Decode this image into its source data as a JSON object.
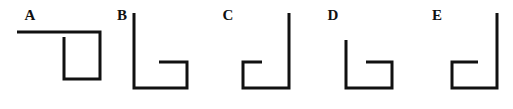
{
  "panel": {
    "name": "bracket-shape-comparison-figure",
    "background_color": "#ffffff",
    "stroke_color": "#111111",
    "stroke_width": 3,
    "width": 513,
    "height": 109
  },
  "figures": [
    {
      "id": "A",
      "label": "A",
      "label_x": 30,
      "label_y": 20,
      "description": "U-bracket with long horizontal arm extending far to the left from the top-right corner",
      "polyline": "17,32 100,32 100,79 64,79 64,37",
      "shape_kind": "extended-top-arm-bracket"
    },
    {
      "id": "B",
      "label": "B",
      "label_x": 122,
      "label_y": 20,
      "description": "Tall left stem, bottom bar, right stem rising to mid height with a short inward arm pointing left",
      "polyline": "134,13 134,88 187,88 187,62 159,62",
      "shape_kind": "tall-left-stem-bracket"
    },
    {
      "id": "C",
      "label": "C",
      "label_x": 228,
      "label_y": 20,
      "description": "Tall right stem, bottom bar, left stem rising to mid height with a short inward arm pointing right",
      "polyline": "289,13 289,88 243,88 243,62 262,62",
      "shape_kind": "tall-right-stem-bracket"
    },
    {
      "id": "D",
      "label": "D",
      "label_x": 333,
      "label_y": 20,
      "description": "Medium left stem, bottom bar, right stem rising to mid height with a short inward arm pointing left",
      "polyline": "346,40 346,88 392,88 392,62 366,62",
      "shape_kind": "short-left-stem-bracket"
    },
    {
      "id": "E",
      "label": "E",
      "label_x": 437,
      "label_y": 20,
      "description": "Tall right stem, bottom bar, left stem rising to mid height with a short inward arm pointing right",
      "polyline": "497,13 497,88 452,88 452,62 478,62",
      "shape_kind": "tall-right-stem-bracket"
    }
  ]
}
